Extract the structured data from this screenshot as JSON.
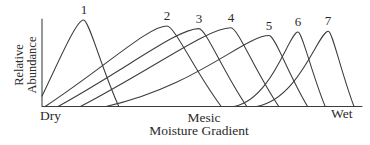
{
  "colors": {
    "line": "#3c3c3c",
    "text": "#2b2b2b",
    "background": "#ffffff"
  },
  "chart_data": {
    "type": "line",
    "title": "",
    "xlabel": "Moisture Gradient",
    "ylabel": "Relative Abundance",
    "x_tick_labels": [
      "Dry",
      "Mesic",
      "Wet"
    ],
    "x_tick_positions": [
      0,
      50,
      100
    ],
    "x_range": [
      0,
      100
    ],
    "y_range": [
      0,
      1
    ],
    "grid": false,
    "legend": "curve numbers printed above each peak",
    "series": [
      {
        "label": "1",
        "base_start": 0,
        "peak_x": 13,
        "peak_y": 1.0,
        "base_end": 24,
        "start_value": 0.12,
        "rise": "straight"
      },
      {
        "label": "2",
        "base_start": 1,
        "peak_x": 39,
        "peak_y": 0.93,
        "base_end": 56,
        "start_value": 0,
        "rise": "straight"
      },
      {
        "label": "3",
        "base_start": 5,
        "peak_x": 49,
        "peak_y": 0.9,
        "base_end": 64,
        "start_value": 0,
        "rise": "straight"
      },
      {
        "label": "4",
        "base_start": 12,
        "peak_x": 59,
        "peak_y": 0.91,
        "base_end": 74,
        "start_value": 0,
        "rise": "straight"
      },
      {
        "label": "5",
        "base_start": 20,
        "peak_x": 71,
        "peak_y": 0.82,
        "base_end": 83,
        "start_value": 0,
        "rise": "moderate"
      },
      {
        "label": "6",
        "base_start": 60,
        "peak_x": 80,
        "peak_y": 0.86,
        "base_end": 88.5,
        "start_value": 0,
        "rise": "sigmoid"
      },
      {
        "label": "7",
        "base_start": 67,
        "peak_x": 89.5,
        "peak_y": 0.87,
        "base_end": 97.5,
        "start_value": 0,
        "rise": "sigmoid"
      }
    ]
  }
}
